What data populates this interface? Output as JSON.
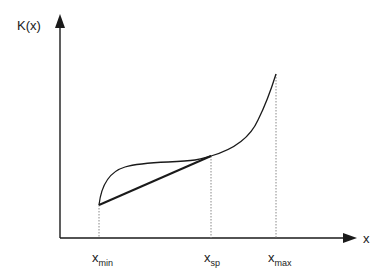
{
  "diagram": {
    "y_axis_label": "K(x)",
    "x_axis_label": "x",
    "tick_labels": [
      {
        "base": "x",
        "sub": "min"
      },
      {
        "base": "x",
        "sub": "sp"
      },
      {
        "base": "x",
        "sub": "max"
      }
    ],
    "colors": {
      "line": "#1a1a1a",
      "axis": "#1a1a1a",
      "dotted": "#888888",
      "background": "#ffffff"
    },
    "elements": [
      "convex-concave curve K(x) from x_min to x_max",
      "straight chord from (x_min, K(x_min)) to (x_sp, K(x_sp))",
      "dotted vertical guides at x_min, x_sp, x_max"
    ]
  }
}
